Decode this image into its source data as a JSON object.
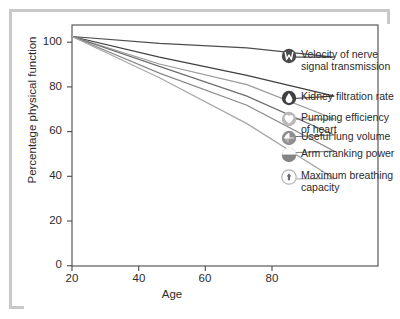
{
  "chart_data": {
    "type": "line",
    "title": "",
    "subtitle": "",
    "xlabel": "Age",
    "ylabel": "Percentage physical function",
    "xlim": [
      20,
      90
    ],
    "ylim": [
      0,
      105
    ],
    "xticks": [
      20,
      40,
      60,
      80
    ],
    "yticks": [
      0,
      20,
      40,
      60,
      80,
      100
    ],
    "xtick_labels": [
      "20",
      "40",
      "60",
      "80"
    ],
    "ytick_labels": [
      "0",
      "20",
      "40",
      "60",
      "80",
      "100"
    ],
    "grid": false,
    "legend_position": "right-inside-plot",
    "x": [
      20,
      40,
      60,
      80
    ],
    "series": [
      {
        "name": "Velocity of nerve\nsignal transmission",
        "label_line1": "Velocity of nerve",
        "label_line2": "signal transmission",
        "icon": "nerve-signal-icon",
        "color": "#4d4d4d",
        "values": [
          100,
          97,
          95,
          91
        ]
      },
      {
        "name": "Kidney filtration rate",
        "label_line1": "Kidney filtration rate",
        "label_line2": "",
        "icon": "kidney-droplet-icon",
        "color": "#3f3f3f",
        "values": [
          100,
          91,
          83,
          74
        ]
      },
      {
        "name": "Pumping efficiency\nof heart",
        "label_line1": "Pumping efficiency",
        "label_line2": "of heart",
        "icon": "heart-icon",
        "color": "#9a9a9a",
        "values": [
          100,
          88,
          79,
          64
        ]
      },
      {
        "name": "Useful lung volume",
        "label_line1": "Useful lung volume",
        "label_line2": "",
        "icon": "lung-volume-icon",
        "color": "#6f6f6f",
        "values": [
          100,
          87,
          74,
          57
        ]
      },
      {
        "name": "Arm cranking power",
        "label_line1": "Arm cranking power",
        "label_line2": "",
        "icon": "arm-power-icon",
        "color": "#8a8a8a",
        "values": [
          100,
          84,
          70,
          50
        ]
      },
      {
        "name": "Maximum breathing\ncapacity",
        "label_line1": "Maximum breathing",
        "label_line2": "capacity",
        "icon": "breathing-capacity-icon",
        "color": "#a8a8a8",
        "values": [
          100,
          82,
          62,
          38
        ]
      }
    ],
    "colors": {
      "axis": "#4a4a4a",
      "text": "#2b2b2b",
      "frame": "#c9c9c9",
      "background": "#ffffff"
    }
  }
}
